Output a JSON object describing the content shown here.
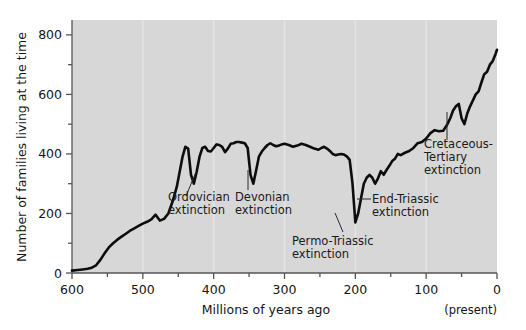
{
  "chart_data": {
    "type": "line",
    "title": "",
    "xlabel": "Millions of years ago",
    "ylabel": "Number of families living at the time",
    "xlim": [
      600,
      0
    ],
    "ylim": [
      0,
      850
    ],
    "x_reversed": true,
    "grid": "vertical-only",
    "legend": "none",
    "x_ticks": [
      600,
      500,
      400,
      300,
      200,
      100,
      0
    ],
    "x_tick_labels": [
      "600",
      "500",
      "400",
      "300",
      "200",
      "100",
      "0"
    ],
    "x_minor_ticks": [
      550,
      450,
      350,
      250,
      150,
      50
    ],
    "y_ticks": [
      0,
      200,
      400,
      600,
      800
    ],
    "y_tick_labels": [
      "0",
      "200",
      "400",
      "600",
      "800"
    ],
    "y_minor_ticks": [
      100,
      300,
      500,
      700
    ],
    "present_label": "(present)",
    "series": [
      {
        "name": "Number of families",
        "x": [
          600,
          592,
          585,
          578,
          572,
          566,
          560,
          554,
          548,
          542,
          536,
          530,
          524,
          518,
          512,
          506,
          500,
          494,
          488,
          482,
          476,
          470,
          464,
          458,
          452,
          448,
          444,
          440,
          436,
          432,
          428,
          424,
          420,
          416,
          412,
          408,
          404,
          400,
          396,
          392,
          388,
          384,
          380,
          376,
          372,
          368,
          364,
          360,
          356,
          352,
          348,
          344,
          340,
          336,
          332,
          328,
          324,
          320,
          316,
          312,
          308,
          304,
          300,
          294,
          288,
          282,
          276,
          270,
          264,
          258,
          252,
          248,
          244,
          240,
          236,
          232,
          228,
          224,
          220,
          216,
          212,
          208,
          204,
          200,
          196,
          192,
          188,
          184,
          180,
          176,
          172,
          168,
          164,
          160,
          156,
          152,
          148,
          144,
          140,
          136,
          130,
          124,
          118,
          112,
          106,
          100,
          94,
          88,
          82,
          76,
          70,
          66,
          62,
          58,
          54,
          50,
          46,
          42,
          38,
          34,
          30,
          26,
          22,
          18,
          14,
          10,
          6,
          2,
          0
        ],
        "y": [
          8,
          10,
          12,
          14,
          18,
          26,
          44,
          66,
          86,
          100,
          112,
          122,
          132,
          142,
          150,
          158,
          166,
          172,
          180,
          196,
          176,
          182,
          200,
          240,
          290,
          340,
          390,
          424,
          418,
          330,
          300,
          340,
          390,
          420,
          424,
          410,
          408,
          420,
          432,
          430,
          424,
          406,
          418,
          434,
          436,
          440,
          440,
          438,
          436,
          420,
          330,
          300,
          345,
          392,
          408,
          420,
          430,
          436,
          430,
          426,
          428,
          432,
          434,
          430,
          424,
          428,
          434,
          430,
          424,
          418,
          414,
          420,
          424,
          418,
          410,
          400,
          396,
          398,
          400,
          398,
          392,
          380,
          300,
          170,
          200,
          250,
          300,
          320,
          330,
          320,
          300,
          318,
          342,
          330,
          346,
          360,
          376,
          384,
          400,
          396,
          404,
          410,
          420,
          436,
          440,
          452,
          470,
          480,
          476,
          478,
          500,
          520,
          546,
          560,
          568,
          520,
          500,
          536,
          560,
          580,
          600,
          610,
          640,
          668,
          676,
          700,
          712,
          736,
          750
        ]
      }
    ],
    "annotations": [
      {
        "id": "ordovician",
        "label_lines": [
          "Ordovician",
          "extinction"
        ],
        "x": 443,
        "y": 330
      },
      {
        "id": "devonian",
        "label_lines": [
          "Devonian",
          "extinction"
        ],
        "x": 360,
        "y": 300
      },
      {
        "id": "permo-triassic",
        "label_lines": [
          "Permo-Triassic",
          "extinction"
        ],
        "x": 251,
        "y": 170
      },
      {
        "id": "end-triassic",
        "label_lines": [
          "End-Triassic",
          "extinction"
        ],
        "x": 203,
        "y": 300
      },
      {
        "id": "cretaceous-tertiary",
        "label_lines": [
          "Cretaceous-",
          "Tertiary",
          "extinction"
        ],
        "x": 66,
        "y": 430
      }
    ]
  },
  "colors": {
    "plot_background": "#d7d7d7",
    "figure_background": "#ffffff",
    "line": "#0d0d0d",
    "axis": "#555555",
    "gridline": "#e4e4e4",
    "text": "#151515"
  }
}
